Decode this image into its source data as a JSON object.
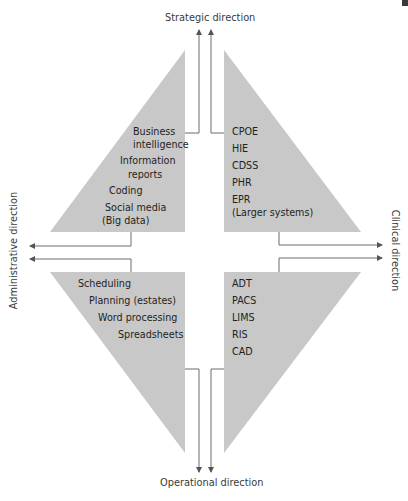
{
  "axes": {
    "top": "Strategic direction",
    "bottom": "Operational direction",
    "left": "Administrative direction",
    "right": "Clinical direction"
  },
  "quadrants": {
    "top_left": {
      "items": [
        "Business",
        "intelligence",
        "Information",
        "reports",
        "Coding",
        "Social media",
        "(Big data)"
      ]
    },
    "top_right": {
      "items": [
        "CPOE",
        "HIE",
        "CDSS",
        "PHR",
        "EPR",
        "(Larger systems)"
      ]
    },
    "bottom_left": {
      "items": [
        "Scheduling",
        "Planning (estates)",
        "Word processing",
        "Spreadsheets"
      ]
    },
    "bottom_right": {
      "items": [
        "ADT",
        "PACS",
        "LIMS",
        "RIS",
        "CAD"
      ]
    }
  },
  "colors": {
    "shape_fill": "#c8c8c8",
    "line": "#6d6d6d",
    "text": "#231f20"
  }
}
